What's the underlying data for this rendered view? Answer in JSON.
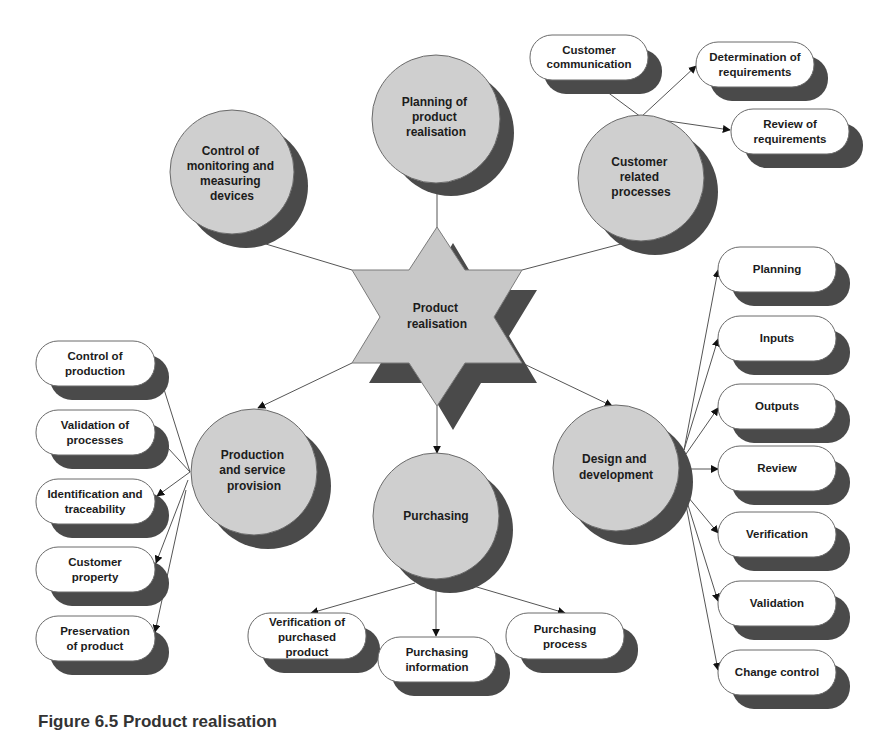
{
  "figure": {
    "caption": "Figure 6.5 Product realisation",
    "colors": {
      "node_fill": "#cfcfcf",
      "shadow": "#4a4a4a",
      "box_fill": "#ffffff",
      "edge": "#555555"
    }
  },
  "center": {
    "label_lines": [
      "Product",
      "realisation"
    ],
    "shape": "six-pointed-star"
  },
  "processes": [
    {
      "id": "planning",
      "label_lines": [
        "Planning of",
        "product",
        "realisation"
      ]
    },
    {
      "id": "customer",
      "label_lines": [
        "Customer",
        "related",
        "processes"
      ]
    },
    {
      "id": "design",
      "label_lines": [
        "Design and",
        "development"
      ]
    },
    {
      "id": "purchasing",
      "label_lines": [
        "Purchasing"
      ]
    },
    {
      "id": "production",
      "label_lines": [
        "Production",
        "and service",
        "provision"
      ]
    },
    {
      "id": "monitoring",
      "label_lines": [
        "Control of",
        "monitoring and",
        "measuring",
        "devices"
      ]
    }
  ],
  "customer_items": [
    {
      "label_lines": [
        "Customer",
        "communication"
      ]
    },
    {
      "label_lines": [
        "Determination of",
        "requirements"
      ]
    },
    {
      "label_lines": [
        "Review of",
        "requirements"
      ]
    }
  ],
  "design_items": [
    {
      "label_lines": [
        "Planning"
      ]
    },
    {
      "label_lines": [
        "Inputs"
      ]
    },
    {
      "label_lines": [
        "Outputs"
      ]
    },
    {
      "label_lines": [
        "Review"
      ]
    },
    {
      "label_lines": [
        "Verification"
      ]
    },
    {
      "label_lines": [
        "Validation"
      ]
    },
    {
      "label_lines": [
        "Change control"
      ]
    }
  ],
  "purchasing_items": [
    {
      "label_lines": [
        "Verification of",
        "purchased",
        "product"
      ]
    },
    {
      "label_lines": [
        "Purchasing",
        "information"
      ]
    },
    {
      "label_lines": [
        "Purchasing",
        "process"
      ]
    }
  ],
  "production_items": [
    {
      "label_lines": [
        "Control of",
        "production"
      ]
    },
    {
      "label_lines": [
        "Validation of",
        "processes"
      ]
    },
    {
      "label_lines": [
        "Identification and",
        "traceability"
      ]
    },
    {
      "label_lines": [
        "Customer",
        "property"
      ]
    },
    {
      "label_lines": [
        "Preservation",
        "of product"
      ]
    }
  ]
}
